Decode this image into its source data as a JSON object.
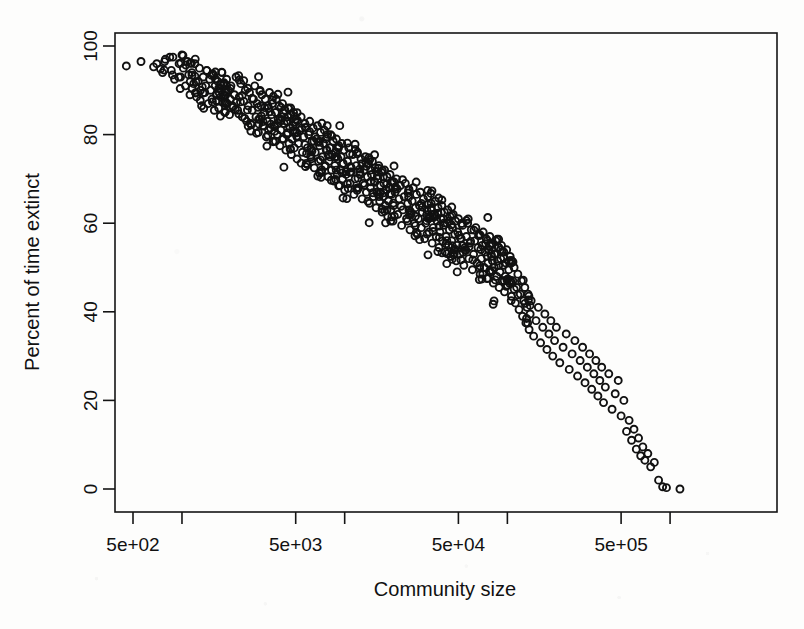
{
  "figure": {
    "width": 804,
    "height": 629,
    "background_color": "#fdfdfc",
    "ink_color": "#111111"
  },
  "chart_data": {
    "type": "scatter",
    "title": "",
    "xlabel": "Community size",
    "ylabel": "Percent of time extinct",
    "grid": false,
    "legend": "none",
    "point_style": {
      "marker": "open-circle",
      "radius_px": 3.5,
      "stroke_width_px": 1.9,
      "color": "#111111"
    },
    "xscale": "log",
    "xlim": [
      330,
      1350000
    ],
    "ylim": [
      -2,
      101
    ],
    "xticks_labeled": [
      {
        "value": 500,
        "label": "5e+02"
      },
      {
        "value": 5000,
        "label": "5e+03"
      },
      {
        "value": 50000,
        "label": "5e+04"
      },
      {
        "value": 500000,
        "label": "5e+05"
      }
    ],
    "xticks_minor": [
      1000,
      10000,
      100000,
      1000000
    ],
    "yticks": [
      {
        "value": 0,
        "label": "0"
      },
      {
        "value": 20,
        "label": "20"
      },
      {
        "value": 40,
        "label": "40"
      },
      {
        "value": 60,
        "label": "60"
      },
      {
        "value": 80,
        "label": "80"
      },
      {
        "value": 100,
        "label": "100"
      }
    ],
    "n_points": 742,
    "relationship": "strong negative log-linear: percent of time extinct declines from ~96% at community size 500 to ~0% at community size ~1e6",
    "points": [
      [
        455,
        95.5
      ],
      [
        560,
        96.5
      ],
      [
        700,
        96.0
      ],
      [
        760,
        94.0
      ],
      [
        790,
        97.0
      ],
      [
        860,
        94.5
      ],
      [
        880,
        97.5
      ],
      [
        900,
        92.5
      ],
      [
        960,
        96.0
      ],
      [
        980,
        93.0
      ],
      [
        1000,
        98.0
      ],
      [
        1020,
        95.0
      ],
      [
        1050,
        91.0
      ],
      [
        1080,
        96.5
      ],
      [
        1100,
        93.5
      ],
      [
        1120,
        89.0
      ],
      [
        1150,
        94.0
      ],
      [
        1180,
        91.5
      ],
      [
        1200,
        96.0
      ],
      [
        1230,
        88.5
      ],
      [
        1260,
        92.0
      ],
      [
        1280,
        95.0
      ],
      [
        1300,
        90.0
      ],
      [
        1320,
        86.5
      ],
      [
        1350,
        93.0
      ],
      [
        1380,
        89.5
      ],
      [
        1400,
        91.0
      ],
      [
        1420,
        94.5
      ],
      [
        1450,
        87.0
      ],
      [
        1480,
        92.5
      ],
      [
        1500,
        90.0
      ],
      [
        1530,
        88.0
      ],
      [
        1560,
        93.5
      ],
      [
        1580,
        85.5
      ],
      [
        1600,
        91.0
      ],
      [
        1630,
        89.0
      ],
      [
        1660,
        92.0
      ],
      [
        1680,
        86.0
      ],
      [
        1700,
        90.5
      ],
      [
        1730,
        88.5
      ],
      [
        1760,
        94.0
      ],
      [
        1780,
        87.5
      ],
      [
        1800,
        91.5
      ],
      [
        1830,
        85.0
      ],
      [
        1860,
        89.5
      ],
      [
        1880,
        92.5
      ],
      [
        1900,
        87.0
      ],
      [
        1930,
        90.0
      ],
      [
        1960,
        84.5
      ],
      [
        1980,
        88.0
      ],
      [
        2000,
        91.0
      ],
      [
        2050,
        86.5
      ],
      [
        2100,
        89.0
      ],
      [
        2150,
        93.0
      ],
      [
        2200,
        85.5
      ],
      [
        2250,
        88.5
      ],
      [
        2300,
        91.5
      ],
      [
        2350,
        84.0
      ],
      [
        2400,
        87.5
      ],
      [
        2450,
        90.0
      ],
      [
        2500,
        83.0
      ],
      [
        2550,
        86.5
      ],
      [
        2600,
        89.5
      ],
      [
        2650,
        82.5
      ],
      [
        2700,
        85.5
      ],
      [
        2750,
        88.0
      ],
      [
        2800,
        91.0
      ],
      [
        2850,
        84.0
      ],
      [
        2900,
        87.0
      ],
      [
        2950,
        80.5
      ],
      [
        3000,
        83.5
      ],
      [
        3050,
        86.5
      ],
      [
        3100,
        89.0
      ],
      [
        3150,
        82.0
      ],
      [
        3200,
        85.0
      ],
      [
        3250,
        88.0
      ],
      [
        3300,
        79.5
      ],
      [
        3350,
        83.0
      ],
      [
        3400,
        86.0
      ],
      [
        3450,
        89.5
      ],
      [
        3500,
        81.5
      ],
      [
        3550,
        84.5
      ],
      [
        3600,
        87.0
      ],
      [
        3650,
        78.5
      ],
      [
        3700,
        82.0
      ],
      [
        3750,
        85.0
      ],
      [
        3800,
        88.0
      ],
      [
        3850,
        80.0
      ],
      [
        3900,
        83.5
      ],
      [
        3950,
        86.5
      ],
      [
        4000,
        77.5
      ],
      [
        4050,
        81.0
      ],
      [
        4100,
        84.0
      ],
      [
        4150,
        87.0
      ],
      [
        4200,
        79.0
      ],
      [
        4250,
        82.5
      ],
      [
        4300,
        85.5
      ],
      [
        4350,
        76.5
      ],
      [
        4400,
        80.0
      ],
      [
        4450,
        83.0
      ],
      [
        4500,
        86.0
      ],
      [
        4550,
        78.0
      ],
      [
        4600,
        81.5
      ],
      [
        4650,
        84.5
      ],
      [
        4700,
        75.5
      ],
      [
        4750,
        79.0
      ],
      [
        4800,
        82.0
      ],
      [
        4850,
        85.0
      ],
      [
        4900,
        77.0
      ],
      [
        4950,
        80.5
      ],
      [
        5000,
        83.5
      ],
      [
        5100,
        74.5
      ],
      [
        5200,
        78.0
      ],
      [
        5300,
        81.0
      ],
      [
        5400,
        84.0
      ],
      [
        5500,
        76.0
      ],
      [
        5600,
        79.5
      ],
      [
        5700,
        82.5
      ],
      [
        5800,
        73.5
      ],
      [
        5900,
        77.0
      ],
      [
        6000,
        80.0
      ],
      [
        6100,
        83.0
      ],
      [
        6200,
        75.0
      ],
      [
        6300,
        78.5
      ],
      [
        6400,
        81.5
      ],
      [
        6500,
        72.5
      ],
      [
        6600,
        76.0
      ],
      [
        6700,
        79.0
      ],
      [
        6800,
        82.0
      ],
      [
        6900,
        74.0
      ],
      [
        7000,
        77.5
      ],
      [
        7100,
        80.5
      ],
      [
        7200,
        71.5
      ],
      [
        7300,
        75.0
      ],
      [
        7400,
        78.0
      ],
      [
        7500,
        81.0
      ],
      [
        7600,
        73.0
      ],
      [
        7700,
        76.5
      ],
      [
        7800,
        79.5
      ],
      [
        7900,
        70.5
      ],
      [
        8000,
        74.0
      ],
      [
        8100,
        77.0
      ],
      [
        8200,
        80.0
      ],
      [
        8300,
        72.0
      ],
      [
        8400,
        75.5
      ],
      [
        8500,
        78.5
      ],
      [
        8600,
        69.5
      ],
      [
        8700,
        73.0
      ],
      [
        8800,
        76.0
      ],
      [
        8900,
        79.0
      ],
      [
        9000,
        71.0
      ],
      [
        9100,
        74.5
      ],
      [
        9200,
        77.5
      ],
      [
        9300,
        68.5
      ],
      [
        9400,
        72.0
      ],
      [
        9500,
        75.0
      ],
      [
        9600,
        78.0
      ],
      [
        9700,
        70.0
      ],
      [
        9800,
        73.5
      ],
      [
        9900,
        76.5
      ],
      [
        10000,
        67.5
      ],
      [
        10200,
        71.0
      ],
      [
        10400,
        74.0
      ],
      [
        10600,
        77.0
      ],
      [
        10800,
        69.0
      ],
      [
        11000,
        72.5
      ],
      [
        11200,
        75.5
      ],
      [
        11400,
        66.5
      ],
      [
        11600,
        70.0
      ],
      [
        11800,
        73.0
      ],
      [
        12000,
        76.0
      ],
      [
        12200,
        68.0
      ],
      [
        12400,
        71.5
      ],
      [
        12600,
        74.5
      ],
      [
        12800,
        65.5
      ],
      [
        13000,
        69.0
      ],
      [
        13200,
        72.0
      ],
      [
        13400,
        75.0
      ],
      [
        13600,
        67.0
      ],
      [
        13800,
        70.5
      ],
      [
        14000,
        73.5
      ],
      [
        14200,
        64.5
      ],
      [
        14400,
        68.0
      ],
      [
        14600,
        71.0
      ],
      [
        14800,
        74.0
      ],
      [
        15000,
        66.0
      ],
      [
        15200,
        69.5
      ],
      [
        15400,
        72.5
      ],
      [
        15600,
        63.5
      ],
      [
        15800,
        67.0
      ],
      [
        16000,
        70.0
      ],
      [
        16200,
        73.0
      ],
      [
        16400,
        65.0
      ],
      [
        16600,
        68.5
      ],
      [
        16800,
        71.5
      ],
      [
        17000,
        62.5
      ],
      [
        17200,
        66.0
      ],
      [
        17400,
        69.0
      ],
      [
        17600,
        72.0
      ],
      [
        17800,
        64.0
      ],
      [
        18000,
        67.5
      ],
      [
        18200,
        70.5
      ],
      [
        18400,
        61.5
      ],
      [
        18600,
        65.0
      ],
      [
        18800,
        68.0
      ],
      [
        19000,
        71.0
      ],
      [
        19200,
        63.0
      ],
      [
        19400,
        66.5
      ],
      [
        19600,
        69.5
      ],
      [
        19800,
        60.5
      ],
      [
        20000,
        64.0
      ],
      [
        20400,
        67.0
      ],
      [
        20800,
        70.0
      ],
      [
        21200,
        62.0
      ],
      [
        21600,
        65.5
      ],
      [
        22000,
        68.5
      ],
      [
        22400,
        59.5
      ],
      [
        22800,
        63.0
      ],
      [
        23200,
        66.0
      ],
      [
        23600,
        69.0
      ],
      [
        24000,
        61.0
      ],
      [
        24400,
        64.5
      ],
      [
        24800,
        67.5
      ],
      [
        25200,
        58.5
      ],
      [
        25600,
        62.0
      ],
      [
        26000,
        65.0
      ],
      [
        26400,
        68.0
      ],
      [
        26800,
        60.0
      ],
      [
        27200,
        63.5
      ],
      [
        27600,
        66.5
      ],
      [
        28000,
        57.5
      ],
      [
        28400,
        61.0
      ],
      [
        28800,
        64.0
      ],
      [
        29200,
        67.0
      ],
      [
        29600,
        59.0
      ],
      [
        30000,
        62.5
      ],
      [
        30500,
        65.5
      ],
      [
        31000,
        56.5
      ],
      [
        31500,
        60.0
      ],
      [
        32000,
        63.0
      ],
      [
        32500,
        66.0
      ],
      [
        33000,
        58.0
      ],
      [
        33500,
        61.5
      ],
      [
        34000,
        64.5
      ],
      [
        34500,
        55.5
      ],
      [
        35000,
        59.0
      ],
      [
        35500,
        62.0
      ],
      [
        36000,
        65.0
      ],
      [
        36500,
        57.0
      ],
      [
        37000,
        60.5
      ],
      [
        37500,
        63.5
      ],
      [
        38000,
        54.5
      ],
      [
        38500,
        58.0
      ],
      [
        39000,
        61.0
      ],
      [
        39500,
        64.0
      ],
      [
        40000,
        56.0
      ],
      [
        40500,
        59.5
      ],
      [
        41000,
        62.5
      ],
      [
        41500,
        53.5
      ],
      [
        42000,
        57.0
      ],
      [
        42500,
        60.0
      ],
      [
        43000,
        63.0
      ],
      [
        43500,
        55.0
      ],
      [
        44000,
        58.5
      ],
      [
        44500,
        61.5
      ],
      [
        45000,
        52.5
      ],
      [
        45500,
        56.0
      ],
      [
        46000,
        59.0
      ],
      [
        46500,
        62.0
      ],
      [
        47000,
        54.0
      ],
      [
        47500,
        57.5
      ],
      [
        48000,
        60.5
      ],
      [
        48500,
        51.5
      ],
      [
        49000,
        55.0
      ],
      [
        49500,
        58.0
      ],
      [
        50000,
        61.0
      ],
      [
        51000,
        53.0
      ],
      [
        52000,
        56.5
      ],
      [
        53000,
        59.5
      ],
      [
        54000,
        50.5
      ],
      [
        55000,
        54.0
      ],
      [
        56000,
        57.0
      ],
      [
        57000,
        60.0
      ],
      [
        58000,
        52.0
      ],
      [
        59000,
        55.5
      ],
      [
        60000,
        58.5
      ],
      [
        61000,
        49.5
      ],
      [
        62000,
        53.0
      ],
      [
        63000,
        56.0
      ],
      [
        64000,
        59.0
      ],
      [
        65000,
        51.0
      ],
      [
        66000,
        54.5
      ],
      [
        67000,
        57.5
      ],
      [
        68000,
        48.5
      ],
      [
        69000,
        52.0
      ],
      [
        70000,
        55.0
      ],
      [
        71000,
        58.0
      ],
      [
        72000,
        50.0
      ],
      [
        73000,
        53.5
      ],
      [
        74000,
        56.5
      ],
      [
        75000,
        47.5
      ],
      [
        76000,
        51.0
      ],
      [
        77000,
        54.0
      ],
      [
        78000,
        57.0
      ],
      [
        79000,
        49.0
      ],
      [
        80000,
        52.5
      ],
      [
        81000,
        55.5
      ],
      [
        82000,
        46.5
      ],
      [
        83000,
        50.0
      ],
      [
        84000,
        53.0
      ],
      [
        85000,
        56.0
      ],
      [
        86000,
        48.0
      ],
      [
        87000,
        51.5
      ],
      [
        88000,
        54.5
      ],
      [
        89000,
        45.5
      ],
      [
        90000,
        49.0
      ],
      [
        91000,
        52.0
      ],
      [
        92000,
        55.0
      ],
      [
        93000,
        47.0
      ],
      [
        94000,
        50.5
      ],
      [
        95000,
        53.5
      ],
      [
        96000,
        44.5
      ],
      [
        97000,
        48.0
      ],
      [
        98000,
        51.0
      ],
      [
        99000,
        54.0
      ],
      [
        100000,
        46.0
      ],
      [
        102000,
        49.5
      ],
      [
        104000,
        52.5
      ],
      [
        106000,
        43.5
      ],
      [
        108000,
        47.0
      ],
      [
        110000,
        50.0
      ],
      [
        112000,
        42.0
      ],
      [
        114000,
        45.5
      ],
      [
        116000,
        48.5
      ],
      [
        118000,
        40.5
      ],
      [
        120000,
        44.0
      ],
      [
        122000,
        47.0
      ],
      [
        124000,
        39.0
      ],
      [
        126000,
        42.5
      ],
      [
        128000,
        45.5
      ],
      [
        130000,
        37.5
      ],
      [
        132000,
        41.0
      ],
      [
        134000,
        44.0
      ],
      [
        136000,
        36.0
      ],
      [
        138000,
        39.5
      ],
      [
        140000,
        42.5
      ],
      [
        145000,
        34.5
      ],
      [
        150000,
        38.0
      ],
      [
        155000,
        41.0
      ],
      [
        160000,
        33.0
      ],
      [
        165000,
        36.5
      ],
      [
        170000,
        39.5
      ],
      [
        175000,
        31.5
      ],
      [
        180000,
        35.0
      ],
      [
        185000,
        38.0
      ],
      [
        190000,
        30.0
      ],
      [
        195000,
        33.5
      ],
      [
        200000,
        36.5
      ],
      [
        210000,
        28.5
      ],
      [
        220000,
        32.0
      ],
      [
        230000,
        35.0
      ],
      [
        240000,
        27.0
      ],
      [
        250000,
        30.5
      ],
      [
        260000,
        33.5
      ],
      [
        270000,
        25.5
      ],
      [
        280000,
        29.0
      ],
      [
        290000,
        32.0
      ],
      [
        300000,
        24.0
      ],
      [
        310000,
        27.5
      ],
      [
        320000,
        30.5
      ],
      [
        330000,
        22.5
      ],
      [
        340000,
        26.0
      ],
      [
        350000,
        29.0
      ],
      [
        360000,
        21.0
      ],
      [
        370000,
        24.5
      ],
      [
        380000,
        27.5
      ],
      [
        390000,
        19.5
      ],
      [
        400000,
        23.0
      ],
      [
        420000,
        26.0
      ],
      [
        440000,
        18.0
      ],
      [
        460000,
        21.5
      ],
      [
        480000,
        24.5
      ],
      [
        500000,
        16.5
      ],
      [
        520000,
        20.0
      ],
      [
        540000,
        13.0
      ],
      [
        560000,
        15.5
      ],
      [
        580000,
        11.0
      ],
      [
        600000,
        13.5
      ],
      [
        620000,
        9.0
      ],
      [
        640000,
        11.5
      ],
      [
        660000,
        7.5
      ],
      [
        680000,
        9.5
      ],
      [
        700000,
        6.5
      ],
      [
        730000,
        8.0
      ],
      [
        760000,
        5.0
      ],
      [
        800000,
        6.0
      ],
      [
        850000,
        2.0
      ],
      [
        900000,
        0.5
      ],
      [
        950000,
        0.3
      ],
      [
        1150000,
        0.0
      ]
    ]
  }
}
